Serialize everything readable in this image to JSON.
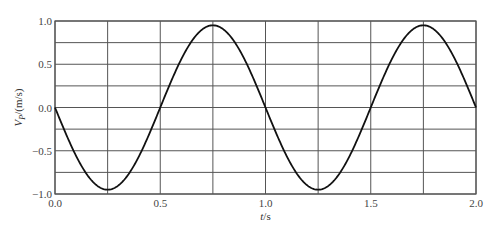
{
  "chart_data": {
    "type": "line",
    "title": "",
    "xlabel": "t/s",
    "ylabel": "V_P/(m/s)",
    "ylabel_main": "V",
    "ylabel_sub": "P",
    "ylabel_rest": "/(m/s)",
    "xlabel_italic": "t",
    "xlabel_rest": "/s",
    "xlim": [
      0.0,
      2.0
    ],
    "ylim": [
      -1.0,
      1.0
    ],
    "grid": true,
    "x_ticks": [
      "0.0",
      "0.5",
      "1.0",
      "1.5",
      "2.0"
    ],
    "x_tick_values": [
      0.0,
      0.5,
      1.0,
      1.5,
      2.0
    ],
    "y_ticks": [
      "1.0",
      "0.5",
      "0.0",
      "-0.5",
      "-1.0"
    ],
    "y_tick_values": [
      1.0,
      0.5,
      0.0,
      -0.5,
      -1.0
    ],
    "x_grid_step": 0.25,
    "y_grid_step": 0.25,
    "series": [
      {
        "name": "V_P",
        "formula": "v = -0.95 * sin(2*pi*t)",
        "amplitude": 0.95,
        "period": 1.0,
        "color": "#111111",
        "x": [
          0.0,
          0.125,
          0.25,
          0.375,
          0.5,
          0.625,
          0.75,
          0.875,
          1.0,
          1.125,
          1.25,
          1.375,
          1.5,
          1.625,
          1.75,
          1.875,
          2.0
        ],
        "values": [
          0.0,
          -0.67,
          -0.95,
          -0.67,
          0.0,
          0.67,
          0.95,
          0.67,
          0.0,
          -0.67,
          -0.95,
          -0.67,
          0.0,
          0.67,
          0.95,
          0.67,
          0.0
        ]
      }
    ]
  },
  "colors": {
    "grid": "#555555",
    "frame": "#555555",
    "curve": "#111111",
    "text": "#444444"
  }
}
